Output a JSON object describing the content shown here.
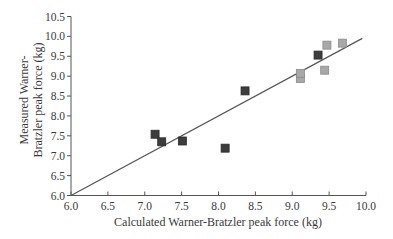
{
  "chart_data": {
    "type": "scatter",
    "title": "",
    "xlabel": "Calculated Warner-Bratzler peak force (kg)",
    "ylabel_lines": [
      "Measured Warner-",
      "Bratzler peak force (kg)"
    ],
    "xlim": [
      6.0,
      10.0
    ],
    "ylim": [
      6.0,
      10.5
    ],
    "x_ticks": [
      "6.0",
      "6.5",
      "7.0",
      "7.5",
      "8.0",
      "8.5",
      "9.0",
      "9.5",
      "10.0"
    ],
    "y_ticks": [
      "6.0",
      "6.5",
      "7.0",
      "7.5",
      "8.0",
      "8.5",
      "9.0",
      "9.5",
      "10.0",
      "10.5"
    ],
    "grid": false,
    "legend": null,
    "series": [
      {
        "name": "dark squares",
        "marker": "square",
        "color": "#3d3d3d",
        "points": [
          {
            "x": 7.14,
            "y": 7.54
          },
          {
            "x": 7.23,
            "y": 7.35
          },
          {
            "x": 7.51,
            "y": 7.37
          },
          {
            "x": 8.09,
            "y": 7.19
          },
          {
            "x": 8.36,
            "y": 8.63
          },
          {
            "x": 9.35,
            "y": 9.53
          }
        ]
      },
      {
        "name": "light squares",
        "marker": "square",
        "color": "#a8a8a8",
        "points": [
          {
            "x": 9.11,
            "y": 8.94
          },
          {
            "x": 9.11,
            "y": 9.07
          },
          {
            "x": 9.44,
            "y": 9.15
          },
          {
            "x": 9.47,
            "y": 9.78
          },
          {
            "x": 9.68,
            "y": 9.83
          }
        ]
      }
    ],
    "reference_line": {
      "x1": 6.0,
      "y1": 6.0,
      "x2": 9.95,
      "y2": 9.95,
      "color": "#555555"
    }
  }
}
